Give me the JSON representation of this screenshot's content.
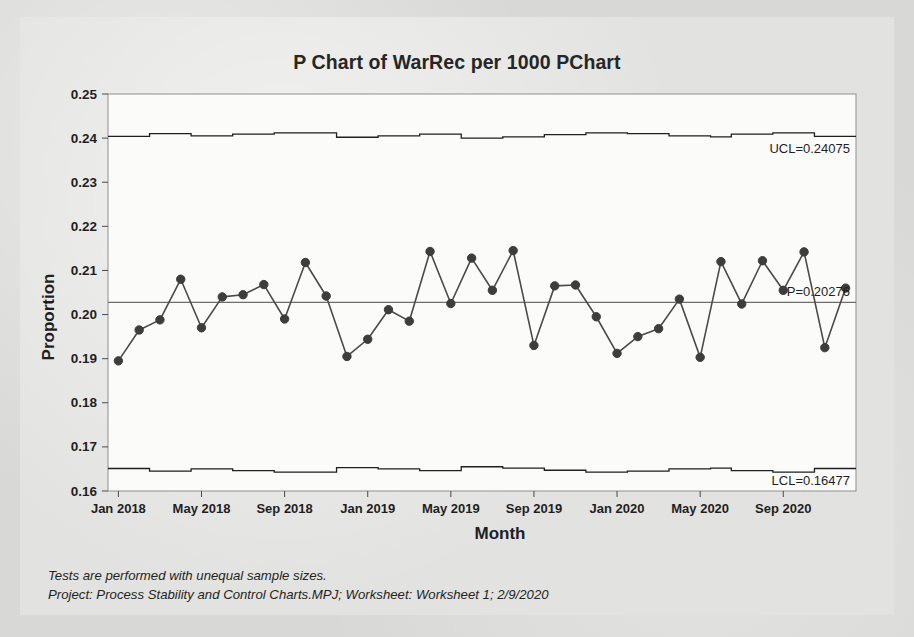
{
  "chart_data": {
    "type": "line",
    "title": "P Chart of WarRec per 1000 PChart",
    "xlabel": "Month",
    "ylabel": "Proportion",
    "ylim": [
      0.16,
      0.25
    ],
    "ytick_labels": [
      "0.25",
      "0.24",
      "0.23",
      "0.22",
      "0.21",
      "0.20",
      "0.19",
      "0.18",
      "0.17",
      "0.16"
    ],
    "ytick_values": [
      0.25,
      0.24,
      0.23,
      0.22,
      0.21,
      0.2,
      0.19,
      0.18,
      0.17,
      0.16
    ],
    "xtick_labels": [
      "Jan 2018",
      "May 2018",
      "Sep 2018",
      "Jan 2019",
      "May 2019",
      "Sep 2019",
      "Jan 2020",
      "May 2020",
      "Sep 2020"
    ],
    "xtick_indices": [
      0,
      4,
      8,
      12,
      16,
      20,
      24,
      28,
      32
    ],
    "grid": false,
    "legend": "none",
    "n_points": 36,
    "series": [
      {
        "name": "Proportion",
        "values": [
          0.1895,
          0.1965,
          0.1988,
          0.208,
          0.197,
          0.204,
          0.2045,
          0.2068,
          0.199,
          0.2118,
          0.2042,
          0.1905,
          0.1944,
          0.2011,
          0.1985,
          0.2143,
          0.2025,
          0.2128,
          0.2055,
          0.2145,
          0.193,
          0.2065,
          0.2067,
          0.1995,
          0.1912,
          0.195,
          0.1968,
          0.2035,
          0.1903,
          0.212,
          0.2024,
          0.2122,
          0.2055,
          0.2142,
          0.1925,
          0.206
        ]
      }
    ],
    "center_line": {
      "name": "P-bar",
      "label": "P=0.20276",
      "value": 0.20276
    },
    "upper_control_limit": {
      "name": "UCL",
      "label": "UCL=0.24075",
      "value": 0.24075,
      "stepped": true,
      "step_values": [
        0.2404,
        0.2404,
        0.241,
        0.241,
        0.2405,
        0.2405,
        0.2409,
        0.2409,
        0.2412,
        0.2412,
        0.2412,
        0.2402,
        0.2402,
        0.2405,
        0.2405,
        0.2409,
        0.2409,
        0.24,
        0.24,
        0.2403,
        0.2403,
        0.2408,
        0.2408,
        0.2412,
        0.2412,
        0.241,
        0.241,
        0.2405,
        0.2405,
        0.2403,
        0.2409,
        0.2409,
        0.2412,
        0.2412,
        0.2404,
        0.2404
      ]
    },
    "lower_control_limit": {
      "name": "LCL",
      "label": "LCL=0.16477",
      "value": 0.16477,
      "stepped": true,
      "step_values": [
        0.1651,
        0.1651,
        0.1645,
        0.1645,
        0.165,
        0.165,
        0.1646,
        0.1646,
        0.1643,
        0.1643,
        0.1643,
        0.1653,
        0.1653,
        0.165,
        0.165,
        0.1646,
        0.1646,
        0.1655,
        0.1655,
        0.1652,
        0.1652,
        0.1647,
        0.1647,
        0.1643,
        0.1643,
        0.1645,
        0.1645,
        0.165,
        0.165,
        0.1652,
        0.1646,
        0.1646,
        0.1643,
        0.1643,
        0.1651,
        0.1651
      ]
    },
    "colors": {
      "marker": "#3d3d3d",
      "line": "#4a4a4a",
      "center_line": "#6e6e6e",
      "control_limit": "#1f1f1f",
      "plot_background": "#fbfbfa",
      "card_background": "#e2e2e0",
      "page_background": "#d8d8d6",
      "text": "#1f1f1f"
    }
  },
  "footnotes": {
    "line1": "Tests are performed with unequal sample sizes.",
    "line2": "Project: Process Stability and Control Charts.MPJ; Worksheet: Worksheet 1; 2/9/2020"
  }
}
